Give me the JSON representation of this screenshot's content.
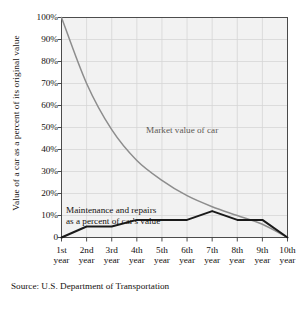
{
  "chart_data": {
    "type": "line",
    "title": "",
    "xlabel": "",
    "ylabel": "Value of a car as a percent of its original value",
    "ylim": [
      0,
      100
    ],
    "ytick_labels": [
      "100%",
      "90%",
      "80%",
      "70%",
      "60%",
      "50%",
      "40%",
      "30%",
      "20%",
      "10%",
      "0"
    ],
    "ytick_values": [
      100,
      90,
      80,
      70,
      60,
      50,
      40,
      30,
      20,
      10,
      0
    ],
    "grid": true,
    "legend_position": "inline-annotations",
    "categories": [
      "1st year",
      "2nd year",
      "3rd year",
      "4th year",
      "5th year",
      "6th year",
      "7th year",
      "8th year",
      "9th year",
      "10th year"
    ],
    "xtick_ordinals": [
      "1st",
      "2nd",
      "3rd",
      "4th",
      "5th",
      "6th",
      "7th",
      "8th",
      "9th",
      "10th"
    ],
    "xtick_unit": "year",
    "series": [
      {
        "name": "Market value of car",
        "color": "#8d8d8d",
        "values": [
          100,
          70,
          49,
          35,
          26,
          19,
          14,
          10,
          6,
          0
        ]
      },
      {
        "name": "Maintenance and repairs as a percent of car's value",
        "color": "#1a1a1a",
        "values": [
          0,
          5,
          5,
          8,
          8,
          8,
          12,
          8,
          8,
          0
        ]
      }
    ],
    "annotations": [
      {
        "id": "market-label",
        "text": "Market value of car"
      },
      {
        "id": "maintenance-label-line1",
        "text": "Maintenance and repairs"
      },
      {
        "id": "maintenance-label-line2",
        "text": "as a percent of car's value"
      }
    ],
    "source": "Source: U.S. Department of Transportation",
    "colors": {
      "plot_background": "#f2f2f2",
      "grid": "#d6d6d6",
      "axis": "#3a3a3a",
      "market_line": "#8d8d8d",
      "maintenance_line": "#1a1a1a"
    }
  }
}
